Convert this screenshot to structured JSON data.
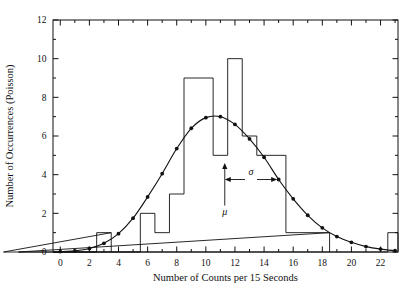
{
  "chart_data": {
    "type": "bar",
    "title": "",
    "xlabel": "Number of Counts per 15 Seconds",
    "ylabel": "Number of Occurrences (Poisson)",
    "xlim": [
      -0.5,
      23.2
    ],
    "ylim": [
      0,
      12
    ],
    "xticks": [
      0,
      2,
      4,
      6,
      8,
      10,
      12,
      14,
      16,
      18,
      20,
      22
    ],
    "xtick_labels": [
      "0",
      "2",
      "4",
      "6",
      "8",
      "10",
      "12",
      "14",
      "16",
      "18",
      "20",
      "22"
    ],
    "x_minor_ticks": [
      1,
      3,
      5,
      7,
      9,
      11,
      13,
      15,
      17,
      19,
      21,
      23
    ],
    "yticks": [
      0,
      2,
      4,
      6,
      8,
      10,
      12
    ],
    "ytick_labels": [
      "0",
      "2",
      "4",
      "6",
      "8",
      "10",
      "12"
    ],
    "y_minor_ticks": [
      1,
      3,
      5,
      7,
      9,
      11
    ],
    "grid": false,
    "legend": "none",
    "bin_width": 1,
    "categories": [
      0,
      1,
      2,
      3,
      4,
      5,
      6,
      7,
      8,
      9,
      10,
      11,
      12,
      13,
      14,
      15,
      16,
      17,
      18,
      19,
      20,
      21,
      22,
      23
    ],
    "values": [
      0,
      0,
      0,
      1,
      0,
      0,
      2,
      1,
      3,
      9,
      9,
      5,
      10,
      6,
      5,
      5,
      1,
      1,
      1,
      0,
      0,
      0,
      0,
      1
    ],
    "histogram_bars": [
      {
        "x_start": 2.5,
        "x_end": 3.5,
        "height": 1
      },
      {
        "x_start": 5.5,
        "x_end": 6.5,
        "height": 2
      },
      {
        "x_start": 6.5,
        "x_end": 7.5,
        "height": 1
      },
      {
        "x_start": 7.5,
        "x_end": 8.5,
        "height": 3
      },
      {
        "x_start": 8.5,
        "x_end": 10.5,
        "height": 9
      },
      {
        "x_start": 10.5,
        "x_end": 11.5,
        "height": 5
      },
      {
        "x_start": 11.5,
        "x_end": 12.5,
        "height": 10
      },
      {
        "x_start": 12.5,
        "x_end": 13.5,
        "height": 6
      },
      {
        "x_start": 13.5,
        "x_end": 15.5,
        "height": 5
      },
      {
        "x_start": 15.5,
        "x_end": 18.5,
        "height": 1
      },
      {
        "x_start": 22.5,
        "x_end": 23.2,
        "height": 1
      }
    ],
    "series": [
      {
        "name": "Poisson fit curve",
        "marker": "filled-circle",
        "x": [
          0,
          1,
          2,
          3,
          4,
          5,
          6,
          7,
          8,
          9,
          10,
          11,
          12,
          13,
          14,
          15,
          16,
          17,
          18,
          19,
          20,
          21,
          22,
          23
        ],
        "values": [
          0.02,
          0.06,
          0.18,
          0.45,
          0.95,
          1.75,
          2.85,
          4.05,
          5.35,
          6.4,
          6.95,
          7.0,
          6.6,
          5.85,
          4.9,
          3.75,
          2.75,
          1.9,
          1.25,
          0.8,
          0.5,
          0.28,
          0.15,
          0.07
        ]
      }
    ],
    "annotations": [
      {
        "name": "mu",
        "label": "μ",
        "x": 11.3,
        "type": "up-arrow",
        "arrow_from_y": 2.4,
        "arrow_to_y": 4.6,
        "label_y": 1.9
      },
      {
        "name": "sigma",
        "label": "σ",
        "type": "double-arrow",
        "x_start": 11.3,
        "x_end": 14.9,
        "y": 3.75
      }
    ]
  }
}
